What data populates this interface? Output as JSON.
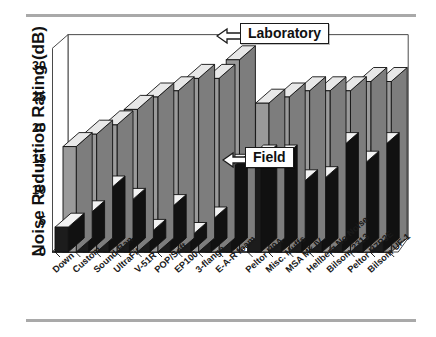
{
  "chart_data": {
    "type": "bar",
    "title": "",
    "subtitle": "",
    "xlabel": "",
    "ylabel": "Noise Reduction Rating (dB)",
    "ylim": [
      0,
      32
    ],
    "yticks": [
      0,
      5,
      10,
      15,
      20,
      25,
      30
    ],
    "grid": false,
    "legend_position": "annotation-callouts",
    "orientation": "vertical",
    "style": "3d-isometric-clustered",
    "categories": [
      "Down",
      "Custom",
      "Sound-Ban",
      "UltraFit",
      "V-51R",
      "POP/Soft",
      "EP100",
      "3-flange",
      "E-A-R foam",
      "Peltor H9A",
      "Misc. Muffs",
      "MSA Mk IV",
      "Hellberg No Noise",
      "Bilsom 2313",
      "Peltor H7P3E",
      "Bilsom UF-1"
    ],
    "series": [
      {
        "name": "Laboratory",
        "color": "#9a9a9a",
        "values": [
          17,
          19,
          20.5,
          23,
          25,
          26,
          28,
          28,
          31,
          24,
          25,
          26,
          26,
          26,
          27.5,
          27.5
        ]
      },
      {
        "name": "Field",
        "color": "#1c1c1c",
        "values": [
          4,
          6,
          10,
          8,
          3,
          7,
          2.5,
          5,
          13.5,
          15,
          15,
          11,
          11.5,
          17,
          14,
          17
        ]
      }
    ],
    "annotations": [
      {
        "name": "laboratory-callout",
        "text": "Laboratory",
        "points_to_series": "Laboratory",
        "points_to_category": "E-A-R foam"
      },
      {
        "name": "field-callout",
        "text": "Field",
        "points_to_series": "Field",
        "points_to_category": "Misc. Muffs"
      }
    ],
    "group_gap_after_index": 8
  }
}
